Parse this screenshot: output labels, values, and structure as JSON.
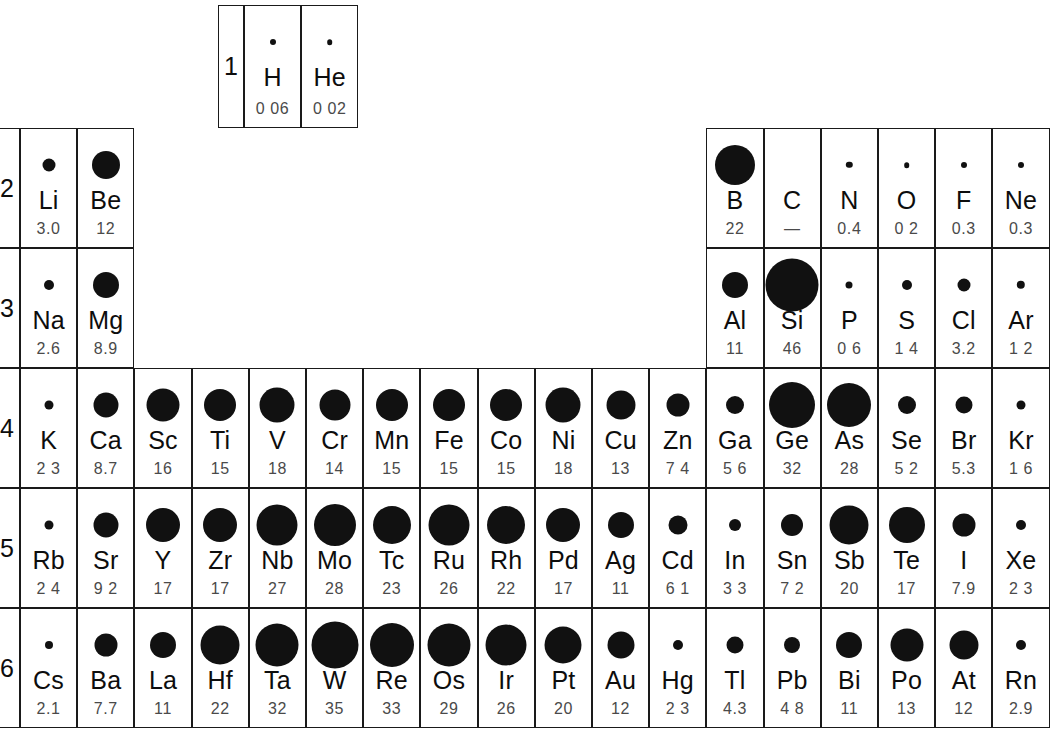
{
  "figure": {
    "kind": "periodic-table-bubble-chart",
    "circle_color": "#111111",
    "grid_color": "#1a1a1a",
    "value_color": "#4a4a4a",
    "symbol_color": "#0d0d0d"
  },
  "period_labels": [
    "1",
    "2",
    "3",
    "4",
    "5",
    "6"
  ],
  "chart_data": {
    "type": "heatmap",
    "title": "",
    "xlabel": "",
    "ylabel": "",
    "encoding": "circle area proportional to value",
    "groups": 18,
    "periods": [
      1,
      2,
      3,
      4,
      5,
      6
    ],
    "categories": [
      "H",
      "He",
      "Li",
      "Be",
      "B",
      "C",
      "N",
      "O",
      "F",
      "Ne",
      "Na",
      "Mg",
      "Al",
      "Si",
      "P",
      "S",
      "Cl",
      "Ar",
      "K",
      "Ca",
      "Sc",
      "Ti",
      "V",
      "Cr",
      "Mn",
      "Fe",
      "Co",
      "Ni",
      "Cu",
      "Zn",
      "Ga",
      "Ge",
      "As",
      "Se",
      "Br",
      "Kr",
      "Rb",
      "Sr",
      "Y",
      "Zr",
      "Nb",
      "Mo",
      "Tc",
      "Ru",
      "Rh",
      "Pd",
      "Ag",
      "Cd",
      "In",
      "Sn",
      "Sb",
      "Te",
      "I",
      "Xe",
      "Cs",
      "Ba",
      "La",
      "Hf",
      "Ta",
      "W",
      "Re",
      "Os",
      "Ir",
      "Pt",
      "Au",
      "Hg",
      "Tl",
      "Pb",
      "Bi",
      "Po",
      "At",
      "Rn"
    ],
    "values": [
      0.06,
      0.02,
      3.0,
      12,
      22,
      null,
      0.4,
      0.2,
      0.3,
      0.3,
      2.6,
      8.9,
      11,
      46,
      0.6,
      1.4,
      3.2,
      1.2,
      2.3,
      8.7,
      16,
      15,
      18,
      14,
      15,
      15,
      15,
      18,
      13,
      7.4,
      5.6,
      32,
      28,
      5.2,
      5.3,
      1.6,
      2.4,
      9.2,
      17,
      17,
      27,
      28,
      23,
      26,
      22,
      17,
      11,
      6.1,
      3.3,
      7.2,
      20,
      17,
      7.9,
      2.3,
      2.1,
      7.7,
      11,
      22,
      32,
      35,
      33,
      29,
      26,
      20,
      12,
      2.3,
      4.3,
      4.8,
      11,
      13,
      12,
      2.9
    ]
  },
  "rows": [
    {
      "period": "1",
      "cells": [
        {
          "symbol": "H",
          "value": "0 06",
          "r": 3.0,
          "col": 1
        },
        {
          "symbol": "He",
          "value": "0 02",
          "r": 2.8,
          "col": 18
        }
      ]
    },
    {
      "period": "2",
      "cells": [
        {
          "symbol": "Li",
          "value": "3.0",
          "r": 6.5,
          "col": 1
        },
        {
          "symbol": "Be",
          "value": "12",
          "r": 14.0,
          "col": 2
        },
        {
          "symbol": "B",
          "value": "22",
          "r": 20.0,
          "col": 13
        },
        {
          "symbol": "C",
          "value": "—",
          "r": 0,
          "col": 14
        },
        {
          "symbol": "N",
          "value": "0.4",
          "r": 3.2,
          "col": 15
        },
        {
          "symbol": "O",
          "value": "0 2",
          "r": 2.8,
          "col": 16
        },
        {
          "symbol": "F",
          "value": "0.3",
          "r": 3.0,
          "col": 17
        },
        {
          "symbol": "Ne",
          "value": "0.3",
          "r": 3.0,
          "col": 18
        }
      ]
    },
    {
      "period": "3",
      "cells": [
        {
          "symbol": "Na",
          "value": "2.6",
          "r": 5.0,
          "col": 1
        },
        {
          "symbol": "Mg",
          "value": "8.9",
          "r": 13.0,
          "col": 2
        },
        {
          "symbol": "Al",
          "value": "11",
          "r": 13.0,
          "col": 13
        },
        {
          "symbol": "Si",
          "value": "46",
          "r": 26.5,
          "col": 14
        },
        {
          "symbol": "P",
          "value": "0 6",
          "r": 3.5,
          "col": 15
        },
        {
          "symbol": "S",
          "value": "1 4",
          "r": 5.0,
          "col": 16
        },
        {
          "symbol": "Cl",
          "value": "3.2",
          "r": 6.5,
          "col": 17
        },
        {
          "symbol": "Ar",
          "value": "1 2",
          "r": 4.2,
          "col": 18
        }
      ]
    },
    {
      "period": "4",
      "cells": [
        {
          "symbol": "K",
          "value": "2 3",
          "r": 4.5,
          "col": 1
        },
        {
          "symbol": "Ca",
          "value": "8.7",
          "r": 12.5,
          "col": 2
        },
        {
          "symbol": "Sc",
          "value": "16",
          "r": 16.5,
          "col": 3
        },
        {
          "symbol": "Ti",
          "value": "15",
          "r": 16.0,
          "col": 4
        },
        {
          "symbol": "V",
          "value": "18",
          "r": 17.5,
          "col": 5
        },
        {
          "symbol": "Cr",
          "value": "14",
          "r": 15.5,
          "col": 6
        },
        {
          "symbol": "Mn",
          "value": "15",
          "r": 16.0,
          "col": 7
        },
        {
          "symbol": "Fe",
          "value": "15",
          "r": 16.0,
          "col": 8
        },
        {
          "symbol": "Co",
          "value": "15",
          "r": 16.0,
          "col": 9
        },
        {
          "symbol": "Ni",
          "value": "18",
          "r": 17.5,
          "col": 10
        },
        {
          "symbol": "Cu",
          "value": "13",
          "r": 14.5,
          "col": 11
        },
        {
          "symbol": "Zn",
          "value": "7 4",
          "r": 11.5,
          "col": 12
        },
        {
          "symbol": "Ga",
          "value": "5 6",
          "r": 9.0,
          "col": 13
        },
        {
          "symbol": "Ge",
          "value": "32",
          "r": 23.0,
          "col": 14
        },
        {
          "symbol": "As",
          "value": "28",
          "r": 22.0,
          "col": 15
        },
        {
          "symbol": "Se",
          "value": "5 2",
          "r": 9.0,
          "col": 16
        },
        {
          "symbol": "Br",
          "value": "5.3",
          "r": 8.5,
          "col": 17
        },
        {
          "symbol": "Kr",
          "value": "1 6",
          "r": 4.5,
          "col": 18
        }
      ]
    },
    {
      "period": "5",
      "cells": [
        {
          "symbol": "Rb",
          "value": "2 4",
          "r": 4.5,
          "col": 1
        },
        {
          "symbol": "Sr",
          "value": "9 2",
          "r": 12.5,
          "col": 2
        },
        {
          "symbol": "Y",
          "value": "17",
          "r": 17.0,
          "col": 3
        },
        {
          "symbol": "Zr",
          "value": "17",
          "r": 17.0,
          "col": 4
        },
        {
          "symbol": "Nb",
          "value": "27",
          "r": 20.5,
          "col": 5
        },
        {
          "symbol": "Mo",
          "value": "28",
          "r": 21.0,
          "col": 6
        },
        {
          "symbol": "Tc",
          "value": "23",
          "r": 19.0,
          "col": 7
        },
        {
          "symbol": "Ru",
          "value": "26",
          "r": 20.5,
          "col": 8
        },
        {
          "symbol": "Rh",
          "value": "22",
          "r": 19.0,
          "col": 9
        },
        {
          "symbol": "Pd",
          "value": "17",
          "r": 17.0,
          "col": 10
        },
        {
          "symbol": "Ag",
          "value": "11",
          "r": 13.0,
          "col": 11
        },
        {
          "symbol": "Cd",
          "value": "6 1",
          "r": 9.5,
          "col": 12
        },
        {
          "symbol": "In",
          "value": "3 3",
          "r": 6.0,
          "col": 13
        },
        {
          "symbol": "Sn",
          "value": "7 2",
          "r": 11.0,
          "col": 14
        },
        {
          "symbol": "Sb",
          "value": "20",
          "r": 19.5,
          "col": 15
        },
        {
          "symbol": "Te",
          "value": "17",
          "r": 18.0,
          "col": 16
        },
        {
          "symbol": "I",
          "value": "7.9",
          "r": 11.5,
          "col": 17
        },
        {
          "symbol": "Xe",
          "value": "2 3",
          "r": 5.0,
          "col": 18
        }
      ]
    },
    {
      "period": "6",
      "cells": [
        {
          "symbol": "Cs",
          "value": "2.1",
          "r": 4.0,
          "col": 1
        },
        {
          "symbol": "Ba",
          "value": "7.7",
          "r": 11.5,
          "col": 2
        },
        {
          "symbol": "La",
          "value": "11",
          "r": 13.0,
          "col": 3
        },
        {
          "symbol": "Hf",
          "value": "22",
          "r": 19.5,
          "col": 4
        },
        {
          "symbol": "Ta",
          "value": "32",
          "r": 21.5,
          "col": 5
        },
        {
          "symbol": "W",
          "value": "35",
          "r": 23.5,
          "col": 6
        },
        {
          "symbol": "Re",
          "value": "33",
          "r": 22.0,
          "col": 7
        },
        {
          "symbol": "Os",
          "value": "29",
          "r": 21.5,
          "col": 8
        },
        {
          "symbol": "Ir",
          "value": "26",
          "r": 20.5,
          "col": 9
        },
        {
          "symbol": "Pt",
          "value": "20",
          "r": 18.5,
          "col": 10
        },
        {
          "symbol": "Au",
          "value": "12",
          "r": 13.5,
          "col": 11
        },
        {
          "symbol": "Hg",
          "value": "2 3",
          "r": 5.0,
          "col": 12
        },
        {
          "symbol": "Tl",
          "value": "4.3",
          "r": 8.5,
          "col": 13
        },
        {
          "symbol": "Pb",
          "value": "4 8",
          "r": 8.0,
          "col": 14
        },
        {
          "symbol": "Bi",
          "value": "11",
          "r": 13.0,
          "col": 15
        },
        {
          "symbol": "Po",
          "value": "13",
          "r": 16.5,
          "col": 16
        },
        {
          "symbol": "At",
          "value": "12",
          "r": 14.5,
          "col": 17
        },
        {
          "symbol": "Rn",
          "value": "2.9",
          "r": 5.0,
          "col": 18
        }
      ]
    }
  ]
}
